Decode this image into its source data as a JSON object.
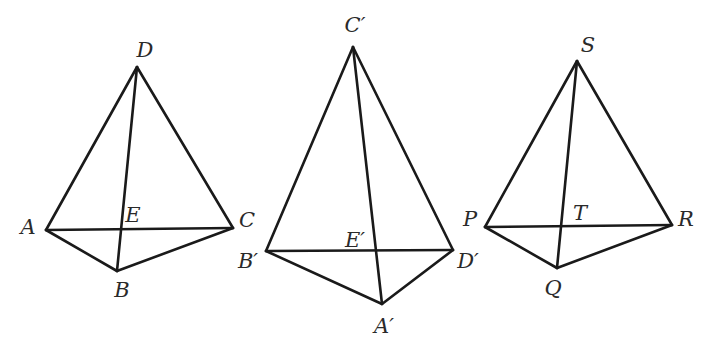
{
  "figure": {
    "top_partial_text": "",
    "stroke_color": "#1a1a1a",
    "label_color": "#2a2a2a",
    "background": "#ffffff"
  },
  "pyramids": [
    {
      "name": "pyramid-ABCD",
      "apex": {
        "label": "D",
        "x": 137,
        "y": 67,
        "lx": 145,
        "ly": 57
      },
      "vertices": [
        {
          "label": "A",
          "x": 46,
          "y": 230,
          "lx": 28,
          "ly": 234
        },
        {
          "label": "B",
          "x": 117,
          "y": 271,
          "lx": 122,
          "ly": 297
        },
        {
          "label": "C",
          "x": 233,
          "y": 228,
          "lx": 247,
          "ly": 227
        }
      ],
      "intersection": {
        "label": "E",
        "x": 122,
        "y": 229,
        "lx": 133,
        "ly": 222
      },
      "edges": [
        [
          "D",
          "A"
        ],
        [
          "D",
          "C"
        ],
        [
          "D",
          "B"
        ],
        [
          "A",
          "C"
        ],
        [
          "A",
          "B"
        ],
        [
          "B",
          "C"
        ]
      ]
    },
    {
      "name": "pyramid-A'B'C'D'",
      "apex": {
        "label": "C′",
        "x": 353,
        "y": 47,
        "lx": 355,
        "ly": 32
      },
      "vertices": [
        {
          "label": "B′",
          "x": 266,
          "y": 251,
          "lx": 248,
          "ly": 268
        },
        {
          "label": "A′",
          "x": 382,
          "y": 304,
          "lx": 384,
          "ly": 333
        },
        {
          "label": "D′",
          "x": 453,
          "y": 250,
          "lx": 468,
          "ly": 268
        }
      ],
      "intersection": {
        "label": "E′",
        "x": 376,
        "y": 251,
        "lx": 355,
        "ly": 247
      },
      "edges": [
        [
          "C′",
          "B′"
        ],
        [
          "C′",
          "D′"
        ],
        [
          "C′",
          "A′"
        ],
        [
          "B′",
          "D′"
        ],
        [
          "B′",
          "A′"
        ],
        [
          "A′",
          "D′"
        ]
      ]
    },
    {
      "name": "pyramid-PQRS",
      "apex": {
        "label": "S",
        "x": 577,
        "y": 61,
        "lx": 588,
        "ly": 52
      },
      "vertices": [
        {
          "label": "P",
          "x": 485,
          "y": 227,
          "lx": 470,
          "ly": 226
        },
        {
          "label": "Q",
          "x": 557,
          "y": 268,
          "lx": 553,
          "ly": 295
        },
        {
          "label": "R",
          "x": 672,
          "y": 225,
          "lx": 686,
          "ly": 226
        }
      ],
      "intersection": {
        "label": "T",
        "x": 561,
        "y": 226,
        "lx": 580,
        "ly": 220
      },
      "edges": [
        [
          "S",
          "P"
        ],
        [
          "S",
          "R"
        ],
        [
          "S",
          "Q"
        ],
        [
          "P",
          "R"
        ],
        [
          "P",
          "Q"
        ],
        [
          "Q",
          "R"
        ]
      ]
    }
  ]
}
